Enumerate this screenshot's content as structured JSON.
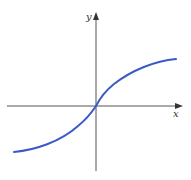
{
  "figure": {
    "type": "function-graph",
    "axes": {
      "x_label": "x",
      "y_label": "y",
      "axis_color": "#555555",
      "origin_px": [
        96,
        106
      ],
      "x_axis_px": {
        "start": 7,
        "end": 181
      },
      "y_axis_px": {
        "start": 13,
        "end": 171
      }
    },
    "curve": {
      "color": "#3a5bc7",
      "width": 2,
      "path": "M14,152 C35,150 60,142 78,126 C88,118 92,112 96,106 C100,98 104,92 114,84 C132,70 155,61 176,59"
    }
  }
}
